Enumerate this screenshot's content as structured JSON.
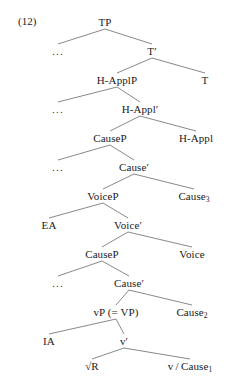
{
  "example": {
    "number": "(12)"
  },
  "tree": {
    "description": "Syntactic tree diagram of a causative-applicative clause structure",
    "nodes": [
      {
        "id": "TP",
        "label": "TP",
        "x": 105,
        "y": 22
      },
      {
        "id": "ell1",
        "label": "...",
        "x": 58,
        "y": 51
      },
      {
        "id": "Tbar",
        "label": "T′",
        "x": 152,
        "y": 51
      },
      {
        "id": "HApplP",
        "label": "H-ApplP",
        "x": 117,
        "y": 80
      },
      {
        "id": "T",
        "label": "T",
        "x": 205,
        "y": 80
      },
      {
        "id": "ell2",
        "label": "...",
        "x": 58,
        "y": 109
      },
      {
        "id": "HApplbar",
        "label": "H-Appl′",
        "x": 140,
        "y": 109
      },
      {
        "id": "CausePhi",
        "label": "CauseP",
        "x": 110,
        "y": 138
      },
      {
        "id": "HAppl",
        "label": "H-Appl",
        "x": 196,
        "y": 138
      },
      {
        "id": "ell3",
        "label": "...",
        "x": 58,
        "y": 167
      },
      {
        "id": "Causebar3",
        "label": "Cause′",
        "x": 134,
        "y": 167
      },
      {
        "id": "VoiceP",
        "label": "VoiceP",
        "x": 103,
        "y": 196
      },
      {
        "id": "Cause3",
        "label": "Cause",
        "sub": "3",
        "x": 194,
        "y": 196
      },
      {
        "id": "EA",
        "label": "EA",
        "x": 49,
        "y": 225
      },
      {
        "id": "Voicebar",
        "label": "Voice′",
        "x": 128,
        "y": 225
      },
      {
        "id": "CausePlo",
        "label": "CauseP",
        "x": 102,
        "y": 254
      },
      {
        "id": "Voice",
        "label": "Voice",
        "x": 192,
        "y": 254
      },
      {
        "id": "ell4",
        "label": "...",
        "x": 58,
        "y": 283
      },
      {
        "id": "Causebar2",
        "label": "Cause′",
        "x": 129,
        "y": 283
      },
      {
        "id": "vP",
        "label": "vP  (= VP)",
        "x": 116,
        "y": 312
      },
      {
        "id": "Cause2",
        "label": "Cause",
        "sub": "2",
        "x": 192,
        "y": 312
      },
      {
        "id": "IA",
        "label": "IA",
        "x": 49,
        "y": 341
      },
      {
        "id": "vbar",
        "label": "v′",
        "x": 124,
        "y": 341
      },
      {
        "id": "rootR",
        "label": "√R",
        "x": 92,
        "y": 366
      },
      {
        "id": "vCause1",
        "label": "v / Cause",
        "sub": "1",
        "x": 190,
        "y": 366
      }
    ],
    "edges": [
      {
        "from": "TP",
        "to": "ell1"
      },
      {
        "from": "TP",
        "to": "Tbar"
      },
      {
        "from": "Tbar",
        "to": "HApplP"
      },
      {
        "from": "Tbar",
        "to": "T"
      },
      {
        "from": "HApplP",
        "to": "ell2"
      },
      {
        "from": "HApplP",
        "to": "HApplbar"
      },
      {
        "from": "HApplbar",
        "to": "CausePhi"
      },
      {
        "from": "HApplbar",
        "to": "HAppl"
      },
      {
        "from": "CausePhi",
        "to": "ell3"
      },
      {
        "from": "CausePhi",
        "to": "Causebar3"
      },
      {
        "from": "Causebar3",
        "to": "VoiceP"
      },
      {
        "from": "Causebar3",
        "to": "Cause3"
      },
      {
        "from": "VoiceP",
        "to": "EA"
      },
      {
        "from": "VoiceP",
        "to": "Voicebar"
      },
      {
        "from": "Voicebar",
        "to": "CausePlo"
      },
      {
        "from": "Voicebar",
        "to": "Voice"
      },
      {
        "from": "CausePlo",
        "to": "ell4"
      },
      {
        "from": "CausePlo",
        "to": "Causebar2"
      },
      {
        "from": "Causebar2",
        "to": "vP"
      },
      {
        "from": "Causebar2",
        "to": "Cause2"
      },
      {
        "from": "vP",
        "to": "IA"
      },
      {
        "from": "vP",
        "to": "vbar"
      },
      {
        "from": "vbar",
        "to": "rootR"
      },
      {
        "from": "vbar",
        "to": "vCause1"
      }
    ]
  },
  "style": {
    "line_color": "#555555",
    "text_color": "#1a1a1a",
    "background": "#ffffff"
  }
}
